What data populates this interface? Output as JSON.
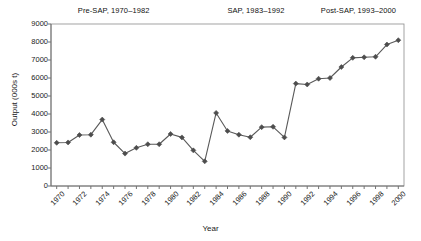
{
  "chart_data": {
    "type": "line",
    "title": "",
    "xlabel": "Year",
    "ylabel": "Output (000s t)",
    "xlim": [
      1969.5,
      2000.5
    ],
    "ylim": [
      0,
      9000
    ],
    "ytick_step": 1000,
    "xtick_step": 2,
    "grid": false,
    "legend": "none",
    "marker": "diamond",
    "series_color": "#595959",
    "x": [
      1970,
      1971,
      1972,
      1973,
      1974,
      1975,
      1976,
      1977,
      1978,
      1979,
      1980,
      1981,
      1982,
      1983,
      1984,
      1985,
      1986,
      1987,
      1988,
      1989,
      1990,
      1991,
      1992,
      1993,
      1994,
      1995,
      1996,
      1997,
      1998,
      1999,
      2000
    ],
    "values": [
      2400,
      2420,
      2830,
      2850,
      3690,
      2430,
      1800,
      2120,
      2320,
      2320,
      2890,
      2700,
      1980,
      1370,
      4060,
      3060,
      2850,
      2710,
      3270,
      3290,
      2700,
      5690,
      5640,
      5960,
      6000,
      6610,
      7120,
      7150,
      7180,
      7860,
      8100
    ],
    "xticklabels": [
      "1970",
      "1972",
      "1974",
      "1976",
      "1978",
      "1980",
      "1982",
      "1984",
      "1986",
      "1988",
      "1990",
      "1992",
      "1994",
      "1996",
      "1998",
      "2000"
    ],
    "yticklabels": [
      "0",
      "1000",
      "2000",
      "3000",
      "4000",
      "5000",
      "6000",
      "7000",
      "8000",
      "9000"
    ],
    "annotations": [
      {
        "name": "pre-sap",
        "text": "Pre-SAP, 1970–1982",
        "x_center": 1975.0
      },
      {
        "name": "sap",
        "text": "SAP, 1983–1992",
        "x_center": 1987.5
      },
      {
        "name": "post-sap",
        "text": "Post-SAP, 1993–2000",
        "x_center": 1996.5
      }
    ]
  },
  "axes": {
    "x_title": "Year",
    "y_title": "Output (000s t)"
  },
  "colors": {
    "line": "#595959",
    "marker": "#4d4d4d",
    "frame": "#8c8c8c",
    "text": "#111111"
  }
}
